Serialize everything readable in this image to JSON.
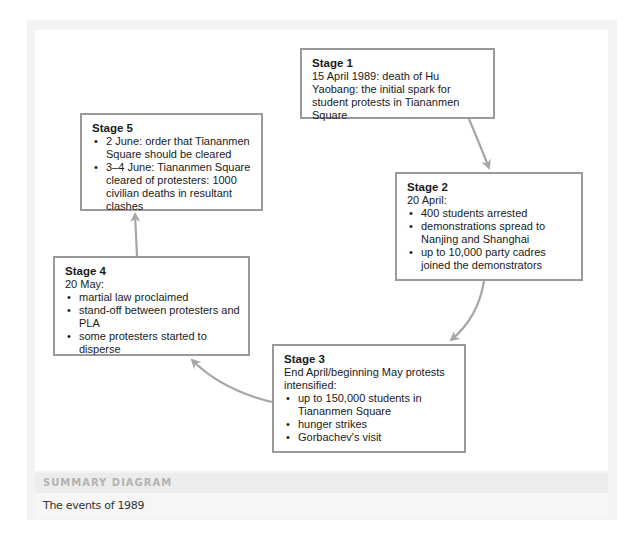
{
  "diagram": {
    "stages": [
      {
        "title": "Stage 1",
        "intro": "15 April 1989: death of Hu Yaobang: the initial spark for student protests in Tiananmen Square",
        "bullets": []
      },
      {
        "title": "Stage 2",
        "intro": "20 April:",
        "bullets": [
          "400 students arrested",
          "demonstrations spread to Nanjing and Shanghai",
          "up to 10,000 party cadres joined the demonstrators"
        ]
      },
      {
        "title": "Stage 3",
        "intro": "End April/beginning May protests intensified:",
        "bullets": [
          "up to 150,000 students in Tiananmen Square",
          "hunger strikes",
          "Gorbachev's visit"
        ]
      },
      {
        "title": "Stage 4",
        "intro": "20 May:",
        "bullets": [
          "martial law proclaimed",
          "stand-off between protesters and PLA",
          "some protesters started to disperse"
        ]
      },
      {
        "title": "Stage 5",
        "intro": "",
        "bullets": [
          "2 June: order that Tiananmen Square should be cleared",
          "3–4 June: Tiananmen Square cleared of protesters: 1000 civilian deaths in resultant clashes"
        ]
      }
    ],
    "arrows": [
      {
        "from": "Stage 1",
        "to": "Stage 2"
      },
      {
        "from": "Stage 2",
        "to": "Stage 3"
      },
      {
        "from": "Stage 3",
        "to": "Stage 4"
      },
      {
        "from": "Stage 4",
        "to": "Stage 5"
      }
    ],
    "colors": {
      "box_border": "#9a9a9a",
      "arrow": "#a6a6a6",
      "frame": "#f3f3f3",
      "header_bg": "#ececec",
      "header_text": "#b3b3b3"
    }
  },
  "summary": {
    "header": "SUMMARY DIAGRAM",
    "caption": "The events of 1989"
  }
}
